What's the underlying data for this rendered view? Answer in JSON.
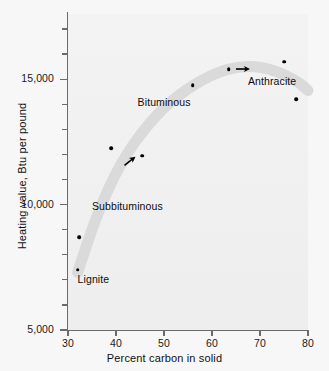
{
  "chart_data": {
    "type": "scatter",
    "title": "",
    "xlabel": "Percent carbon in solid",
    "ylabel": "Heating value, Btu per pound",
    "xlim": [
      30,
      80
    ],
    "ylim": [
      5000,
      17600
    ],
    "grid": false,
    "legend_position": "none",
    "x_ticks": [
      {
        "value": 30,
        "label": "30"
      },
      {
        "value": 40,
        "label": "40"
      },
      {
        "value": 50,
        "label": "50"
      },
      {
        "value": 60,
        "label": "60"
      },
      {
        "value": 70,
        "label": "70"
      },
      {
        "value": 80,
        "label": "80"
      }
    ],
    "y_ticks": [
      {
        "value": 5000,
        "label": "5,000",
        "major": true
      },
      {
        "value": 6000,
        "label": "",
        "major": false
      },
      {
        "value": 7000,
        "label": "",
        "major": false
      },
      {
        "value": 8000,
        "label": "",
        "major": false
      },
      {
        "value": 9000,
        "label": "",
        "major": false
      },
      {
        "value": 10000,
        "label": "10,000",
        "major": true
      },
      {
        "value": 11000,
        "label": "",
        "major": false
      },
      {
        "value": 12000,
        "label": "",
        "major": false
      },
      {
        "value": 13000,
        "label": "",
        "major": false
      },
      {
        "value": 14000,
        "label": "",
        "major": false
      },
      {
        "value": 15000,
        "label": "15,000",
        "major": true
      },
      {
        "value": 16000,
        "label": "",
        "major": false
      },
      {
        "value": 17000,
        "label": "",
        "major": false
      }
    ],
    "points": [
      {
        "x": 32.0,
        "y": 7400
      },
      {
        "x": 32.3,
        "y": 8700
      },
      {
        "x": 39.0,
        "y": 12250
      },
      {
        "x": 45.5,
        "y": 11950
      },
      {
        "x": 56.0,
        "y": 14750
      },
      {
        "x": 63.5,
        "y": 15400
      },
      {
        "x": 75.0,
        "y": 15700
      },
      {
        "x": 77.5,
        "y": 14200
      }
    ],
    "trend_band": {
      "color": "#d8d8d8",
      "description": "broad shaded band rising steeply from lignite through subbituminous, peaking near 65 percent carbon then declining toward anthracite",
      "path_points": [
        {
          "x": 32.0,
          "y": 7300
        },
        {
          "x": 36.0,
          "y": 9600
        },
        {
          "x": 41.0,
          "y": 11700
        },
        {
          "x": 47.0,
          "y": 13300
        },
        {
          "x": 53.0,
          "y": 14400
        },
        {
          "x": 60.0,
          "y": 15200
        },
        {
          "x": 66.0,
          "y": 15550
        },
        {
          "x": 72.0,
          "y": 15450
        },
        {
          "x": 78.0,
          "y": 14900
        },
        {
          "x": 80.0,
          "y": 14550
        }
      ]
    },
    "annotations": [
      {
        "name": "lignite",
        "text": "Lignite",
        "x": 32.0,
        "y": 7000
      },
      {
        "name": "subbituminous",
        "text": "Subbituminous",
        "x": 35.0,
        "y": 9900
      },
      {
        "name": "bituminous",
        "text": "Bituminous",
        "x": 44.5,
        "y": 14050
      },
      {
        "name": "anthracite",
        "text": "Anthracite",
        "x": 67.5,
        "y": 14900
      }
    ],
    "arrows": [
      {
        "name": "arrow-subbituminous",
        "x": 43.0,
        "y": 11750,
        "direction": "up-right"
      },
      {
        "name": "arrow-anthracite",
        "x": 66.5,
        "y": 15400,
        "direction": "right"
      }
    ],
    "colors": {
      "background": "#f7f7f7",
      "plot_background": "#efefef",
      "axis": "#6b6b6b",
      "point": "#000000",
      "band": "#d8d8d8",
      "text": "#111111"
    }
  }
}
